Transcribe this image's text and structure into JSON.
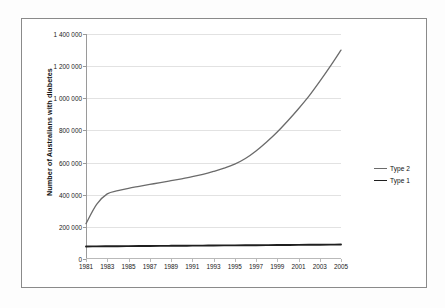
{
  "chart_data": {
    "type": "line",
    "title": "",
    "xlabel": "",
    "ylabel": "Number of Australians with diabetes",
    "xlim": [
      1981,
      2005
    ],
    "ylim": [
      0,
      1400000
    ],
    "grid": true,
    "legend_position": "right",
    "x_tick_labels": [
      "1981",
      "1983",
      "1985",
      "1987",
      "1989",
      "1991",
      "1993",
      "1995",
      "1997",
      "1999",
      "2001",
      "2003",
      "2005"
    ],
    "x_tick_values": [
      1981,
      1983,
      1985,
      1987,
      1989,
      1991,
      1993,
      1995,
      1997,
      1999,
      2001,
      2003,
      2005
    ],
    "y_tick_labels": [
      "0",
      "200 000",
      "400 000",
      "600 000",
      "800 000",
      "1 000 000",
      "1 200 000",
      "1 400 000"
    ],
    "y_tick_values": [
      0,
      200000,
      400000,
      600000,
      800000,
      1000000,
      1200000,
      1400000
    ],
    "x": [
      1981,
      1982,
      1983,
      1984,
      1985,
      1986,
      1987,
      1988,
      1989,
      1990,
      1991,
      1992,
      1993,
      1994,
      1995,
      1996,
      1997,
      1998,
      1999,
      2000,
      2001,
      2002,
      2003,
      2004,
      2005
    ],
    "series": [
      {
        "name": "Type 2",
        "color": "#6b6b6b",
        "values": [
          220000,
          340000,
          405000,
          425000,
          440000,
          452000,
          464000,
          475000,
          487000,
          499000,
          512000,
          527000,
          545000,
          565000,
          590000,
          625000,
          672000,
          728000,
          790000,
          860000,
          935000,
          1015000,
          1105000,
          1200000,
          1300000
        ]
      },
      {
        "name": "Type 1",
        "color": "#1f1f1f",
        "values": [
          78000,
          78500,
          79000,
          79500,
          80000,
          80500,
          81000,
          81500,
          82000,
          82500,
          83000,
          83500,
          84000,
          84500,
          85000,
          85500,
          86000,
          86500,
          87000,
          87500,
          88000,
          88500,
          89000,
          89500,
          90000
        ]
      }
    ]
  },
  "legend": {
    "entries": [
      {
        "label": "Type 2",
        "color": "#6b6b6b"
      },
      {
        "label": "Type 1",
        "color": "#1f1f1f"
      }
    ]
  },
  "colors": {
    "frame_border": "#8a8a8a",
    "gridline": "#e2e2e2",
    "axis": "#9a9a9a",
    "background": "#ffffff",
    "type2": "#6b6b6b",
    "type1": "#1f1f1f"
  }
}
